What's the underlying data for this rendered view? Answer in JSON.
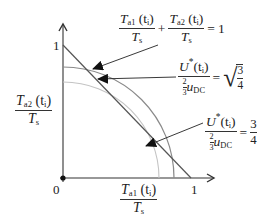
{
  "diagram": {
    "axes": {
      "origin_label": "0",
      "x_tick_label": "1",
      "y_tick_label": "1",
      "x_label": {
        "num_T": "T",
        "num_sub": "a1",
        "num_arg": "(t",
        "num_arg_sub": "i",
        "num_close": ")",
        "den_T": "T",
        "den_sub": "s"
      },
      "y_label": {
        "num_T": "T",
        "num_sub": "a2",
        "num_arg": "(t",
        "num_arg_sub": "i",
        "num_close": ")",
        "den_T": "T",
        "den_sub": "s"
      }
    },
    "annotations": [
      {
        "id": "line-sum",
        "text": "T_a1(t_i)/T_s + T_a2(t_i)/T_s = 1",
        "t1": "T",
        "s1": "a1",
        "arg": "(t",
        "argsub": "i",
        "close": ")",
        "d1": "T",
        "ds1": "s",
        "plus": "+",
        "t2": "T",
        "s2": "a2",
        "d2": "T",
        "ds2": "s",
        "eq": "=",
        "rhs": "1"
      },
      {
        "id": "arc-sqrt",
        "text": "U*(t_i) / (2/3 u_DC) = sqrt(3/4)",
        "U": "U",
        "star": "*",
        "arg": "(t",
        "argsub": "i",
        "close": ")",
        "two": "2",
        "three": "3",
        "u": "u",
        "usub": "DC",
        "eq": "=",
        "rnum": "3",
        "rden": "4"
      },
      {
        "id": "arc-three-quarters",
        "text": "U*(t_i) / (2/3 u_DC) = 3/4",
        "U": "U",
        "star": "*",
        "arg": "(t",
        "argsub": "i",
        "close": ")",
        "two": "2",
        "three": "3",
        "u": "u",
        "usub": "DC",
        "eq": "=",
        "rnum": "3",
        "rden": "4"
      }
    ],
    "curves": [
      {
        "name": "boundary-line",
        "type": "line",
        "from": [
          0,
          1
        ],
        "to": [
          1,
          0
        ],
        "color": "#555555"
      },
      {
        "name": "arc-sqrt-3-4",
        "type": "arc",
        "radius": 0.866,
        "color": "#888888"
      },
      {
        "name": "arc-3-4",
        "type": "arc",
        "radius": 0.75,
        "color": "#bbbbbb"
      }
    ],
    "colors": {
      "axis": "#333333",
      "line": "#555555",
      "arc_outer": "#8a8a8a",
      "arc_inner": "#bdbdbd",
      "arrow": "#222222"
    }
  }
}
